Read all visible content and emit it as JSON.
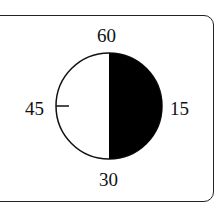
{
  "diagram": {
    "type": "clock-dial",
    "labels": {
      "top": "60",
      "right": "15",
      "bottom": "30",
      "left": "45"
    },
    "shaded_segment": {
      "from_minute": 0,
      "to_minute": 30,
      "color": "#000000"
    },
    "unshaded_color": "#ffffff",
    "tick_marks": [
      "45"
    ]
  }
}
